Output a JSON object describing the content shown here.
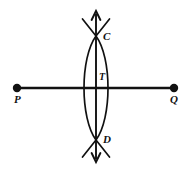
{
  "figure": {
    "kind": "geometry-construction-diagram",
    "width": 192,
    "height": 171,
    "background_color": "#ffffff",
    "stroke_color": "#111111"
  },
  "labels": {
    "P": "P",
    "Q": "Q",
    "C": "C",
    "D": "D",
    "T": "T"
  },
  "geometry": {
    "horizontal_line": {
      "name": "line-PQ",
      "x1": 17,
      "y1": 88,
      "x2": 174,
      "y2": 88,
      "stroke_width": 2.4,
      "endpoint_dots": [
        {
          "name": "point-P",
          "cx": 17,
          "cy": 88,
          "r": 4.2
        },
        {
          "name": "point-Q",
          "cx": 174,
          "cy": 88,
          "r": 4.2
        }
      ]
    },
    "vertical_line": {
      "name": "line-CD",
      "x": 96,
      "y_top": 13,
      "y_bottom": 160,
      "stroke_width": 1.9,
      "arrow_top": {
        "tip_y": 10,
        "half_width": 4.5,
        "length": 9
      },
      "arrow_bottom": {
        "tip_y": 163,
        "half_width": 4.5,
        "length": 9
      }
    },
    "intersections": {
      "C": {
        "x": 96,
        "y": 36
      },
      "D": {
        "x": 96,
        "y": 140
      },
      "T": {
        "x": 96,
        "y": 88
      }
    },
    "arcs": [
      {
        "name": "arc-left",
        "start_x": 96,
        "start_y": 36,
        "end_x": 96,
        "end_y": 140,
        "bulge_x": 82,
        "stroke_width": 1.7
      },
      {
        "name": "arc-right",
        "start_x": 96,
        "start_y": 36,
        "end_x": 96,
        "end_y": 140,
        "bulge_x": 110,
        "stroke_width": 1.7
      }
    ],
    "arc_extensions": [
      {
        "name": "arc-extension-top-left",
        "x1": 96,
        "y1": 36,
        "x2": 83,
        "y2": 20
      },
      {
        "name": "arc-extension-top-right",
        "x1": 96,
        "y1": 36,
        "x2": 109,
        "y2": 20
      },
      {
        "name": "arc-extension-bottom-left",
        "x1": 96,
        "y1": 140,
        "x2": 83,
        "y2": 157
      },
      {
        "name": "arc-extension-bottom-right",
        "x1": 96,
        "y1": 140,
        "x2": 109,
        "y2": 157
      }
    ]
  }
}
